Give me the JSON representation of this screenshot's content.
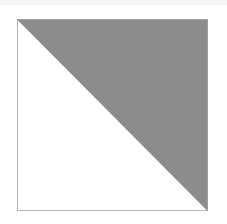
{
  "diagram": {
    "shape": "square-split-by-diagonal",
    "square": {
      "x": 17,
      "y": 19,
      "width": 191,
      "height": 192
    },
    "colors": {
      "background": "#ffffff",
      "shaded_triangle": "#8c8c8c",
      "unshaded_triangle": "#ffffff",
      "border": "#b4b4b4",
      "top_band": "#f4f4f4"
    },
    "shaded_region": "upper-right triangle",
    "diagonal": "top-left to bottom-right"
  }
}
